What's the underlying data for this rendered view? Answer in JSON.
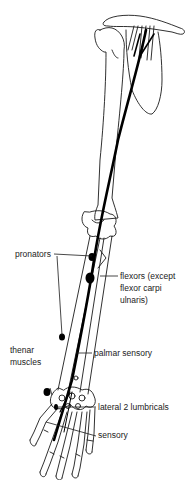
{
  "diagram": {
    "colors": {
      "outline": "#1a1a1a",
      "nerve": "#000000",
      "background": "#ffffff"
    },
    "labels": {
      "pronators": "pronators",
      "flexors_line1": "flexors (except",
      "flexors_line2": "flexor carpi",
      "flexors_line3": "ulnaris)",
      "thenar_line1": "thenar",
      "thenar_line2": "muscles",
      "palmar_sensory": "palmar sensory",
      "lateral_lumbricals": "lateral 2 lumbricals",
      "sensory": "sensory"
    }
  }
}
